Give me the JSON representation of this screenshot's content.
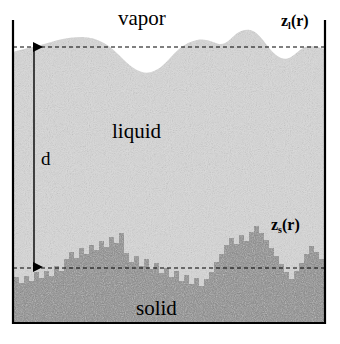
{
  "figure": {
    "title_region_labels": {
      "vapor": "vapor",
      "liquid": "liquid",
      "solid": "solid"
    },
    "distance_label": "d",
    "interface_labels": {
      "liquid_surface": {
        "symbol": "z",
        "subscript": "l",
        "argument": "(r)"
      },
      "solid_surface": {
        "symbol": "z",
        "subscript": "s",
        "argument": "(r)"
      }
    },
    "colors": {
      "vapor_fill": "#ffffff",
      "liquid_fill": "#d8d8d8",
      "solid_fill": "#8a8a8a",
      "frame_stroke": "#000000",
      "dashed_line": "#000000",
      "arrow": "#000000",
      "text": "#000000"
    },
    "frame": {
      "left": 13,
      "right": 325,
      "top": 38,
      "bottom": 323,
      "top_open": true
    },
    "dashed_levels": {
      "liquid_mean_z": 47,
      "solid_mean_z": 268
    },
    "arrow": {
      "x": 34,
      "top_y": 46,
      "bottom_y": 268,
      "double_headed": true
    },
    "profiles": {
      "liquid_surface_smooth": true,
      "solid_surface_blocky": true
    }
  }
}
